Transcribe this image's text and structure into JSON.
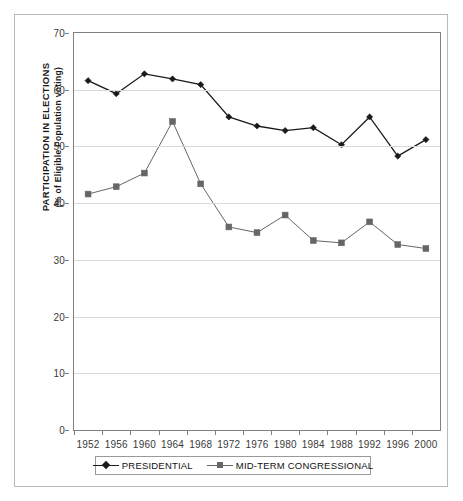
{
  "chart_data": {
    "type": "line",
    "title": "",
    "xlabel": "",
    "ylabel": "PARTICIPATION IN ELECTIONS",
    "ylabel_sub": "(% of Eligible Population voting)",
    "categories": [
      "1952",
      "1956",
      "1960",
      "1964",
      "1968",
      "1972",
      "1976",
      "1980",
      "1984",
      "1988",
      "1992",
      "1996",
      "2000"
    ],
    "ylim": [
      0,
      70
    ],
    "yticks": [
      0,
      10,
      20,
      30,
      40,
      50,
      60,
      70
    ],
    "grid": true,
    "legend_position": "bottom",
    "series": [
      {
        "name": "PRESIDENTIAL",
        "color": "#1a1a1a",
        "marker": "diamond",
        "values": [
          61.6,
          59.3,
          62.8,
          61.9,
          60.9,
          55.2,
          53.6,
          52.8,
          53.3,
          50.3,
          55.2,
          48.3,
          51.2
        ]
      },
      {
        "name": "MID-TERM CONGRESSIONAL",
        "color": "#666666",
        "marker": "square",
        "values": [
          41.6,
          42.9,
          45.3,
          54.4,
          43.4,
          35.8,
          34.8,
          37.9,
          33.4,
          33.0,
          36.7,
          32.7,
          32.0
        ]
      }
    ]
  },
  "axis": {
    "ytick_labels": [
      "70",
      "60",
      "50",
      "40",
      "30",
      "20",
      "10",
      "0"
    ],
    "xtick_labels": [
      "1952",
      "1956",
      "1960",
      "1964",
      "1968",
      "1972",
      "1976",
      "1980",
      "1984",
      "1988",
      "1992",
      "1996",
      "2000"
    ]
  },
  "legend": {
    "entries": [
      {
        "label": "PRESIDENTIAL"
      },
      {
        "label": "MID-TERM CONGRESSIONAL"
      }
    ]
  },
  "colors": {
    "presidential": "#1a1a1a",
    "midterm": "#666666",
    "grid": "#d9d9d9",
    "axis": "#808080",
    "frame": "#b9b9b9"
  }
}
